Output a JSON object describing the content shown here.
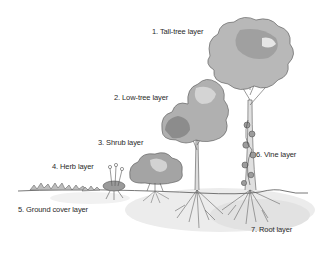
{
  "diagram": {
    "style": "grayscale watercolor illustration",
    "colors": {
      "background": "#ffffff",
      "text": "#2a2a2a",
      "foliage_dark": "#8a8a8a",
      "foliage_light": "#c8c8c8",
      "outline": "#555555",
      "soil_shadow": "#e6e6e6"
    },
    "labels": [
      {
        "id": "tall-tree",
        "text": "1. Tall-tree layer"
      },
      {
        "id": "low-tree",
        "text": "2. Low-tree layer"
      },
      {
        "id": "shrub",
        "text": "3. Shrub layer"
      },
      {
        "id": "herb",
        "text": "4. Herb layer"
      },
      {
        "id": "ground-cover",
        "text": "5. Ground cover layer"
      },
      {
        "id": "vine",
        "text": "6. Vine layer"
      },
      {
        "id": "root",
        "text": "7. Root layer"
      }
    ]
  }
}
